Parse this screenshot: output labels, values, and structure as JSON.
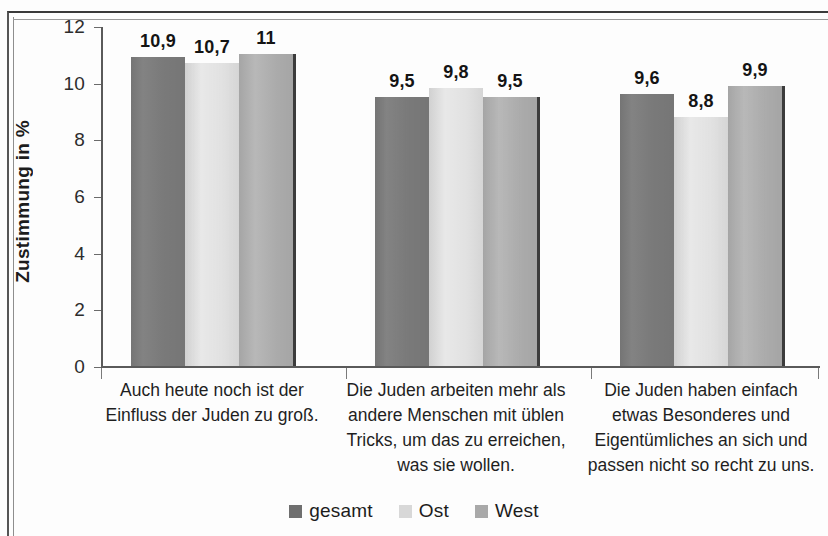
{
  "chart_data": {
    "type": "bar",
    "title": "",
    "xlabel": "",
    "ylabel": "Zustimmung in %",
    "ylim": [
      0,
      12
    ],
    "yticks": [
      0,
      2,
      4,
      6,
      8,
      10,
      12
    ],
    "ytick_labels": [
      "0",
      "2",
      "4",
      "6",
      "8",
      "10",
      "12"
    ],
    "grid": false,
    "legend_position": "bottom-center",
    "value_decimal_separator": ",",
    "categories": [
      "Auch heute noch ist der\nEinfluss der Juden zu groß.",
      "Die Juden arbeiten mehr als\nandere Menschen mit üblen\nTricks, um das zu erreichen,\nwas sie wollen.",
      "Die Juden haben einfach\netwas Besonderes und\nEigentümliches an sich und\npassen nicht so recht zu uns."
    ],
    "series": [
      {
        "name": "gesamt",
        "color": "#7c7c7c",
        "values": [
          10.9,
          9.5,
          9.6
        ],
        "value_labels": [
          "10,9",
          "9,5",
          "9,6"
        ]
      },
      {
        "name": "Ost",
        "color": "#dcdcdc",
        "values": [
          10.7,
          9.8,
          8.8
        ],
        "value_labels": [
          "10,7",
          "9,8",
          "8,8"
        ]
      },
      {
        "name": "West",
        "color": "#aeaeae",
        "values": [
          11.0,
          9.5,
          9.9
        ],
        "value_labels": [
          "11",
          "9,5",
          "9,9"
        ]
      }
    ]
  },
  "axis": {
    "y_title": "Zustimmung in %",
    "y_tick_labels": [
      "12",
      "10",
      "8",
      "6",
      "4",
      "2",
      "0"
    ]
  },
  "legend": {
    "items": [
      {
        "label": "gesamt"
      },
      {
        "label": "Ost"
      },
      {
        "label": "West"
      }
    ]
  },
  "categories_display": [
    "Auch heute noch ist der\nEinfluss der Juden zu groß.",
    "Die Juden arbeiten mehr als\nandere Menschen mit üblen\nTricks, um das zu erreichen,\nwas sie wollen.",
    "Die Juden haben einfach\netwas Besonderes und\nEigentümliches an sich und\npassen nicht so recht zu uns."
  ],
  "values_flat": {
    "g0": [
      "10,9",
      "10,7",
      "11"
    ],
    "g1": [
      "9,5",
      "9,8",
      "9,5"
    ],
    "g2": [
      "9,6",
      "8,8",
      "9,9"
    ]
  }
}
